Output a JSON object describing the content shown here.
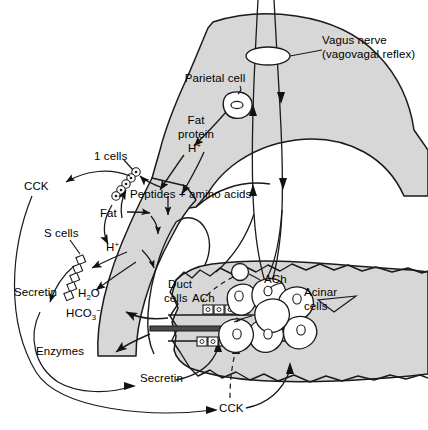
{
  "figure": {
    "type": "physiology-diagram",
    "background_color": "#ffffff",
    "organ_fill_color": "#d7d7d7",
    "organ_stroke_color": "#1a1a1a",
    "arrow_color": "#1a1a1a"
  },
  "labels": {
    "vagus_nerve_line1": "Vagus nerve",
    "vagus_nerve_line2": "(vagovagal reflex)",
    "parietal_cell": "Parietal cell",
    "fat": "Fat",
    "protein": "protein",
    "h_plus": "H",
    "h_plus_sup": "+",
    "i_cells": "1 cells",
    "cck_left": "CCK",
    "peptides_amino_acids": "Peptides + amino acids",
    "fat_duodenum": "Fat",
    "h_plus_duodenum": "H",
    "h_plus_duodenum_sup": "+",
    "s_cells": "S cells",
    "secretin_left": "Secretin",
    "h2o": "H",
    "h2o_sub": "2",
    "h2o_tail": "O",
    "hco3": "HCO",
    "hco3_sub": "3",
    "hco3_sup": "−",
    "enzymes": "Enzymes",
    "duct_cells_line1": "Duct",
    "duct_cells_line2": "cells",
    "ach_duct": "ACh",
    "ach_acinar": "ACh",
    "acinar_cells_line1": "Acinar",
    "acinar_cells_line2": "cells",
    "secretin_bottom": "Secretin",
    "cck_bottom": "CCK"
  },
  "structures": {
    "stomach": "stomach-antrum-and-body",
    "duodenum": "duodenum-c-loop",
    "pancreas": "pancreas-body",
    "parietal_cell_shape": "parietal-cell",
    "i_cell_markers": "circle-cells-on-duodenal-mucosa",
    "s_cell_markers": "square-cells-on-duodenal-mucosa",
    "acinus": "acinar-cell-cluster",
    "duct_epithelium": "duct-cell-row",
    "vagus_fibers": "vagal-nerve-fibers",
    "vagus_ganglion": "vagus-ganglion-ellipse"
  }
}
